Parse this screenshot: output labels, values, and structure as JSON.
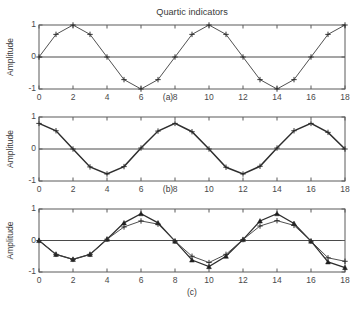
{
  "figure": {
    "title": "Quartic indicators",
    "background_color": "#ffffff",
    "line_color": "#3c3c3c",
    "axis_color": "#5a5a5a"
  },
  "chart_data": [
    {
      "type": "line",
      "panel": "(a)",
      "title": "Quartic indicators",
      "xlabel": "(a)",
      "ylabel": "Amplitude",
      "xlim": [
        0,
        18
      ],
      "ylim": [
        -1,
        1
      ],
      "xticks": [
        0,
        2,
        4,
        6,
        8,
        10,
        12,
        14,
        16,
        18
      ],
      "yticks": [
        -1,
        0,
        1
      ],
      "xticklabels": [
        "0",
        "2",
        "4",
        "6",
        "8",
        "10",
        "12",
        "14",
        "16",
        "18"
      ],
      "yticklabels": [
        "-1",
        "0",
        "1"
      ],
      "grid": false,
      "legend": "none",
      "marker": "plus",
      "x": [
        0,
        1,
        2,
        3,
        4,
        5,
        6,
        7,
        8,
        9,
        10,
        11,
        12,
        13,
        14,
        15,
        16,
        17,
        18
      ],
      "series": [
        {
          "name": "sine",
          "marker": "plus",
          "values": [
            0,
            0.707,
            1,
            0.707,
            0,
            -0.707,
            -1,
            -0.707,
            0,
            0.707,
            1,
            0.707,
            0,
            -0.707,
            -1,
            -0.707,
            0,
            0.707,
            1
          ]
        }
      ]
    },
    {
      "type": "line",
      "panel": "(b)",
      "xlabel": "(b)",
      "ylabel": "Amplitude",
      "xlim": [
        0,
        18
      ],
      "ylim": [
        -1,
        1
      ],
      "xticks": [
        0,
        2,
        4,
        6,
        8,
        10,
        12,
        14,
        16,
        18
      ],
      "yticks": [
        -1,
        0,
        1
      ],
      "xticklabels": [
        "0",
        "2",
        "4",
        "6",
        "8",
        "10",
        "12",
        "14",
        "16",
        "18"
      ],
      "yticklabels": [
        "-1",
        "0",
        "1"
      ],
      "grid": false,
      "legend": "none",
      "marker": "plus",
      "x": [
        0,
        1,
        2,
        3,
        4,
        5,
        6,
        7,
        8,
        9,
        10,
        11,
        12,
        13,
        14,
        15,
        16,
        17,
        18
      ],
      "series": [
        {
          "name": "cosine-attenuated",
          "marker": "plus",
          "values": [
            0.8,
            0.57,
            0.0,
            -0.56,
            -0.78,
            -0.55,
            0.03,
            0.56,
            0.8,
            0.54,
            0.0,
            -0.57,
            -0.78,
            -0.54,
            0.03,
            0.57,
            0.8,
            0.52,
            0.0
          ]
        }
      ]
    },
    {
      "type": "line",
      "panel": "(c)",
      "xlabel": "(c)",
      "ylabel": "Amplitude",
      "xlim": [
        0,
        18
      ],
      "ylim": [
        -1,
        1
      ],
      "xticks": [
        0,
        2,
        4,
        6,
        8,
        10,
        12,
        14,
        16,
        18
      ],
      "yticks": [
        -1,
        0,
        1
      ],
      "xticklabels": [
        "0",
        "2",
        "4",
        "6",
        "8",
        "10",
        "12",
        "14",
        "16",
        "18"
      ],
      "yticklabels": [
        "-1",
        "0",
        "1"
      ],
      "grid": false,
      "legend": "none",
      "x": [
        0,
        1,
        2,
        3,
        4,
        5,
        6,
        7,
        8,
        9,
        10,
        11,
        12,
        13,
        14,
        15,
        16,
        17,
        18
      ],
      "series": [
        {
          "name": "upper-amplitude",
          "marker": "triangle",
          "values": [
            0,
            -0.44,
            -0.6,
            -0.44,
            0.04,
            0.56,
            0.85,
            0.56,
            -0.02,
            -0.62,
            -0.83,
            -0.5,
            0.03,
            0.62,
            0.85,
            0.54,
            -0.02,
            -0.68,
            -0.86
          ]
        },
        {
          "name": "lower-amplitude",
          "marker": "plus",
          "values": [
            0,
            -0.44,
            -0.6,
            -0.44,
            0.04,
            0.43,
            0.62,
            0.52,
            -0.02,
            -0.5,
            -0.7,
            -0.44,
            0.03,
            0.46,
            0.63,
            0.48,
            -0.02,
            -0.55,
            -0.66
          ]
        }
      ]
    }
  ]
}
